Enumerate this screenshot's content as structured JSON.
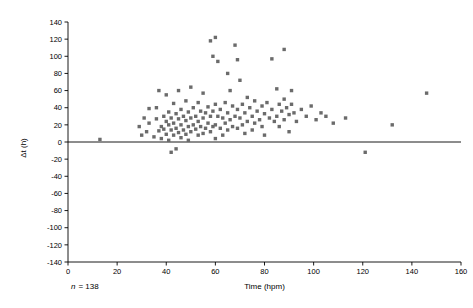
{
  "chart_data": {
    "type": "scatter",
    "title": "",
    "xlabel": "Time (hpm)",
    "ylabel": "Δt (h)",
    "xlim": [
      0,
      160
    ],
    "ylim": [
      -140,
      140
    ],
    "xticks": [
      0,
      20,
      40,
      60,
      80,
      100,
      120,
      140,
      160
    ],
    "yticks": [
      -140,
      -120,
      -100,
      -80,
      -60,
      -40,
      -20,
      0,
      20,
      40,
      60,
      80,
      100,
      120,
      140
    ],
    "grid": false,
    "legend": null,
    "zero_reference_line": 0,
    "annotation_n": "n = 138",
    "annotation_n_label": "n",
    "annotation_n_value": "= 138",
    "marker_color": "#6b6b6b",
    "points": [
      [
        13,
        3
      ],
      [
        29,
        18
      ],
      [
        30,
        8
      ],
      [
        31,
        28
      ],
      [
        32,
        12
      ],
      [
        33,
        39
      ],
      [
        33,
        22
      ],
      [
        35,
        6
      ],
      [
        36,
        40
      ],
      [
        36,
        27
      ],
      [
        37,
        13
      ],
      [
        37,
        60
      ],
      [
        38,
        18
      ],
      [
        38,
        4
      ],
      [
        39,
        30
      ],
      [
        39,
        15
      ],
      [
        40,
        55
      ],
      [
        40,
        24
      ],
      [
        40,
        9
      ],
      [
        41,
        35
      ],
      [
        41,
        20
      ],
      [
        41,
        2
      ],
      [
        42,
        14
      ],
      [
        42,
        28
      ],
      [
        42,
        -12
      ],
      [
        43,
        45
      ],
      [
        43,
        22
      ],
      [
        43,
        8
      ],
      [
        44,
        33
      ],
      [
        44,
        16
      ],
      [
        44,
        -8
      ],
      [
        45,
        60
      ],
      [
        45,
        27
      ],
      [
        45,
        11
      ],
      [
        46,
        38
      ],
      [
        46,
        20
      ],
      [
        46,
        5
      ],
      [
        47,
        30
      ],
      [
        47,
        14
      ],
      [
        48,
        48
      ],
      [
        48,
        25
      ],
      [
        48,
        9
      ],
      [
        49,
        35
      ],
      [
        49,
        18
      ],
      [
        49,
        2
      ],
      [
        50,
        64
      ],
      [
        50,
        28
      ],
      [
        50,
        12
      ],
      [
        51,
        40
      ],
      [
        51,
        20
      ],
      [
        52,
        30
      ],
      [
        52,
        15
      ],
      [
        53,
        46
      ],
      [
        53,
        24
      ],
      [
        53,
        8
      ],
      [
        54,
        36
      ],
      [
        54,
        18
      ],
      [
        55,
        57
      ],
      [
        55,
        28
      ],
      [
        55,
        10
      ],
      [
        56,
        34
      ],
      [
        56,
        16
      ],
      [
        57,
        41
      ],
      [
        57,
        22
      ],
      [
        58,
        118
      ],
      [
        58,
        30
      ],
      [
        58,
        12
      ],
      [
        59,
        100
      ],
      [
        59,
        36
      ],
      [
        59,
        18
      ],
      [
        60,
        122
      ],
      [
        60,
        44
      ],
      [
        60,
        20
      ],
      [
        60,
        4
      ],
      [
        61,
        94
      ],
      [
        61,
        30
      ],
      [
        62,
        38
      ],
      [
        62,
        16
      ],
      [
        63,
        28
      ],
      [
        63,
        8
      ],
      [
        64,
        46
      ],
      [
        64,
        22
      ],
      [
        65,
        80
      ],
      [
        65,
        34
      ],
      [
        65,
        14
      ],
      [
        66,
        60
      ],
      [
        66,
        26
      ],
      [
        67,
        42
      ],
      [
        67,
        18
      ],
      [
        68,
        113
      ],
      [
        68,
        30
      ],
      [
        69,
        96
      ],
      [
        69,
        38
      ],
      [
        69,
        16
      ],
      [
        70,
        72
      ],
      [
        70,
        28
      ],
      [
        71,
        44
      ],
      [
        71,
        20
      ],
      [
        72,
        34
      ],
      [
        72,
        10
      ],
      [
        73,
        52
      ],
      [
        73,
        24
      ],
      [
        74,
        40
      ],
      [
        75,
        30
      ],
      [
        75,
        14
      ],
      [
        76,
        48
      ],
      [
        76,
        22
      ],
      [
        77,
        36
      ],
      [
        78,
        26
      ],
      [
        79,
        42
      ],
      [
        79,
        18
      ],
      [
        80,
        33
      ],
      [
        80,
        8
      ],
      [
        81,
        46
      ],
      [
        82,
        28
      ],
      [
        83,
        97
      ],
      [
        83,
        38
      ],
      [
        84,
        24
      ],
      [
        85,
        62
      ],
      [
        85,
        30
      ],
      [
        86,
        44
      ],
      [
        86,
        18
      ],
      [
        87,
        36
      ],
      [
        88,
        108
      ],
      [
        88,
        50
      ],
      [
        88,
        26
      ],
      [
        89,
        40
      ],
      [
        90,
        32
      ],
      [
        90,
        12
      ],
      [
        91,
        60
      ],
      [
        91,
        44
      ],
      [
        92,
        34
      ],
      [
        93,
        24
      ],
      [
        95,
        38
      ],
      [
        97,
        30
      ],
      [
        99,
        42
      ],
      [
        101,
        26
      ],
      [
        103,
        34
      ],
      [
        105,
        30
      ],
      [
        108,
        22
      ],
      [
        113,
        28
      ],
      [
        121,
        -12
      ],
      [
        132,
        20
      ],
      [
        146,
        57
      ]
    ]
  },
  "axis": {
    "y_title": "Δt (h)",
    "x_title": "Time (hpm)"
  }
}
